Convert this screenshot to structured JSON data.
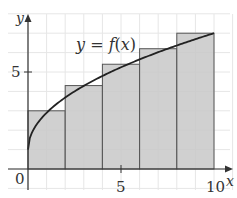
{
  "chart_data": {
    "type": "bar",
    "title": "",
    "subtitle": "",
    "xlabel": "x",
    "ylabel": "y",
    "xlim": [
      0,
      10
    ],
    "ylim": [
      0,
      7.5
    ],
    "grid": true,
    "x_ticks": [
      0,
      5,
      10
    ],
    "y_ticks": [
      5
    ],
    "x_tick_labels": [
      "0",
      "5",
      "10"
    ],
    "y_tick_labels": [
      "5"
    ],
    "categories": [
      "[0,2]",
      "[2,4]",
      "[4,6]",
      "[6,8]",
      "[8,10]"
    ],
    "bars": [
      {
        "x0": 0,
        "x1": 2,
        "height": 3.0
      },
      {
        "x0": 2,
        "x1": 4,
        "height": 4.3
      },
      {
        "x0": 4,
        "x1": 6,
        "height": 5.4
      },
      {
        "x0": 6,
        "x1": 8,
        "height": 6.2
      },
      {
        "x0": 8,
        "x1": 10,
        "height": 7.0
      }
    ],
    "values": [
      3.0,
      4.3,
      5.4,
      6.2,
      7.0
    ],
    "curve": {
      "label": "y = f(x)",
      "points": [
        [
          0,
          1.0
        ],
        [
          0.5,
          2.1
        ],
        [
          1,
          2.7
        ],
        [
          2,
          3.0
        ],
        [
          3,
          3.7
        ],
        [
          4,
          4.3
        ],
        [
          5,
          4.9
        ],
        [
          6,
          5.4
        ],
        [
          7,
          5.8
        ],
        [
          8,
          6.2
        ],
        [
          9,
          6.6
        ],
        [
          10,
          7.0
        ]
      ]
    },
    "annotations": [
      "y = f(x)"
    ],
    "legend": null,
    "colors": {
      "bar_fill": "#c8c8c8",
      "bar_stroke": "#555555",
      "curve": "#222222",
      "grid": "#e6e6e6",
      "axis": "#333333"
    }
  },
  "labels": {
    "origin": "0",
    "x_axis": "x",
    "y_axis": "y",
    "x_tick_5": "5",
    "x_tick_10": "10",
    "y_tick_5": "5",
    "curve": "y = f(x)"
  }
}
